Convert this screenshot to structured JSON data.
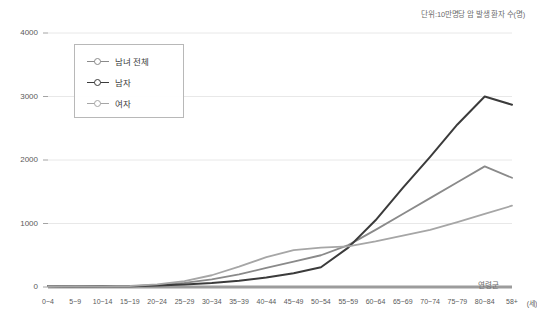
{
  "chart_data": {
    "type": "line",
    "title": "",
    "unit_note": "단위:10만명당 암 발생 환자 수(명)",
    "xlabel": "연령군",
    "xlabel_suffix": "(세)",
    "ylabel": "",
    "ylim": [
      0,
      4000
    ],
    "yticks": [
      0,
      1000,
      2000,
      3000,
      4000
    ],
    "ytick_labels": [
      "0",
      "1000",
      "2000",
      "3000",
      "4000"
    ],
    "grid": true,
    "legend_position": "upper-left-inset",
    "categories": [
      "0~4",
      "5~9",
      "10~14",
      "15~19",
      "20~24",
      "25~29",
      "30~34",
      "35~39",
      "40~44",
      "45~49",
      "50~54",
      "55~59",
      "60~64",
      "65~69",
      "70~74",
      "75~79",
      "80~84",
      "58+"
    ],
    "series": [
      {
        "name": "남녀 전체",
        "color": "#8a8a8a",
        "values": [
          14,
          8,
          9,
          14,
          31,
          65,
          120,
          200,
          300,
          400,
          500,
          660,
          900,
          1150,
          1400,
          1650,
          1900,
          1720
        ]
      },
      {
        "name": "남자",
        "color": "#3b3b3b",
        "values": [
          15,
          9,
          10,
          13,
          24,
          40,
          64,
          100,
          150,
          215,
          310,
          620,
          1050,
          1560,
          2050,
          2560,
          3000,
          2870
        ]
      },
      {
        "name": "여자",
        "color": "#a6a6a6",
        "values": [
          13,
          8,
          9,
          16,
          40,
          92,
          185,
          320,
          470,
          580,
          620,
          640,
          720,
          810,
          900,
          1020,
          1150,
          1280
        ]
      }
    ]
  }
}
